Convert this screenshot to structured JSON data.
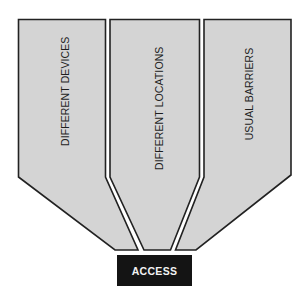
{
  "diagram": {
    "type": "funnel",
    "columns": [
      {
        "id": "devices",
        "label": "DIFFERENT DEVICES"
      },
      {
        "id": "locations",
        "label": "DIFFERENT LOCATIONS"
      },
      {
        "id": "barriers",
        "label": "USUAL BARRIERS"
      }
    ],
    "target": {
      "label": "ACCESS"
    },
    "colors": {
      "column_fill": "#d4d4d4",
      "outline": "#222222",
      "target_fill": "#141414",
      "target_text": "#f2f2f2"
    }
  }
}
